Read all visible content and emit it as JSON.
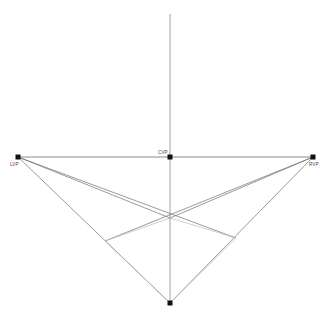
{
  "diagram": {
    "canvas": {
      "width": 329,
      "height": 319,
      "background": "#ffffff"
    },
    "colors": {
      "horizon_line": "#6d6d6d",
      "vertical_axis": "#8a8a8a",
      "construction_line": "#6f6f6f",
      "box_edge": "#b9b9b9",
      "point_fill": "#111111",
      "label_text": "#4a4a4a"
    },
    "points": [
      {
        "id": "lvp",
        "label": "LVP",
        "x": 18,
        "y": 157,
        "marker": true,
        "label_dx": -8,
        "label_dy": 9
      },
      {
        "id": "cvp",
        "label": "CVP",
        "x": 170,
        "y": 157,
        "marker": true,
        "label_dx": -12,
        "label_dy": -3
      },
      {
        "id": "rvp",
        "label": "RVP",
        "x": 313,
        "y": 157,
        "marker": true,
        "label_dx": -4,
        "label_dy": 9
      },
      {
        "id": "bvp",
        "label": "",
        "x": 170,
        "y": 303,
        "marker": true,
        "label_dx": 0,
        "label_dy": 0
      },
      {
        "id": "near",
        "label": "",
        "x": 170,
        "y": 218,
        "marker": false,
        "label_dx": 0,
        "label_dy": 0
      },
      {
        "id": "left_corner",
        "label": "",
        "x": 105,
        "y": 241,
        "marker": false,
        "label_dx": 0,
        "label_dy": 0
      },
      {
        "id": "right_corner",
        "label": "",
        "x": 236,
        "y": 238,
        "marker": false,
        "label_dx": 0,
        "label_dy": 0
      }
    ],
    "lines": [
      {
        "id": "horizon",
        "name": "horizon-line",
        "x1": 18,
        "y1": 157,
        "x2": 313,
        "y2": 157,
        "stroke": "#6d6d6d",
        "width": 0.8
      },
      {
        "id": "vertical-axis",
        "name": "vertical-axis-line",
        "x1": 170,
        "y1": 14,
        "x2": 170,
        "y2": 303,
        "stroke": "#8a8a8a",
        "width": 0.8
      },
      {
        "id": "lvp-near",
        "name": "lvp-to-near-corner",
        "x1": 18,
        "y1": 157,
        "x2": 170,
        "y2": 218,
        "stroke": "#6f6f6f",
        "width": 0.7
      },
      {
        "id": "lvp-right",
        "name": "lvp-to-right-corner",
        "x1": 18,
        "y1": 157,
        "x2": 236,
        "y2": 238,
        "stroke": "#6f6f6f",
        "width": 0.7
      },
      {
        "id": "lvp-bottom",
        "name": "lvp-to-bottom-vertex",
        "x1": 18,
        "y1": 157,
        "x2": 170,
        "y2": 303,
        "stroke": "#6f6f6f",
        "width": 0.7
      },
      {
        "id": "rvp-near",
        "name": "rvp-to-near-corner",
        "x1": 313,
        "y1": 157,
        "x2": 170,
        "y2": 218,
        "stroke": "#6f6f6f",
        "width": 0.7
      },
      {
        "id": "rvp-left",
        "name": "rvp-to-left-corner",
        "x1": 313,
        "y1": 157,
        "x2": 105,
        "y2": 241,
        "stroke": "#6f6f6f",
        "width": 0.7
      },
      {
        "id": "rvp-bottom",
        "name": "rvp-to-bottom-vertex",
        "x1": 313,
        "y1": 157,
        "x2": 170,
        "y2": 303,
        "stroke": "#6f6f6f",
        "width": 0.7
      },
      {
        "id": "edge-near-left",
        "name": "box-edge-near-to-left-corner",
        "x1": 170,
        "y1": 218,
        "x2": 105,
        "y2": 241,
        "stroke": "#b9b9b9",
        "width": 0.7
      },
      {
        "id": "edge-near-right",
        "name": "box-edge-near-to-right-corner",
        "x1": 170,
        "y1": 218,
        "x2": 236,
        "y2": 238,
        "stroke": "#b9b9b9",
        "width": 0.7
      },
      {
        "id": "edge-left-bottom",
        "name": "box-edge-left-corner-to-bottom",
        "x1": 105,
        "y1": 241,
        "x2": 170,
        "y2": 303,
        "stroke": "#b9b9b9",
        "width": 0.7
      },
      {
        "id": "edge-right-bottom",
        "name": "box-edge-right-corner-to-bottom",
        "x1": 236,
        "y1": 238,
        "x2": 170,
        "y2": 303,
        "stroke": "#b9b9b9",
        "width": 0.7
      }
    ]
  }
}
